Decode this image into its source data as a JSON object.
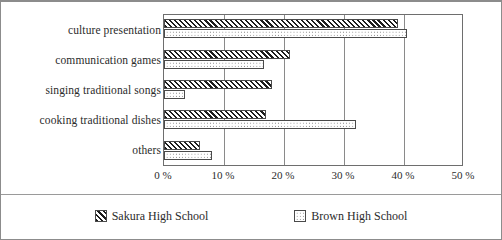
{
  "chart_data": {
    "type": "bar",
    "orientation": "horizontal",
    "title": "",
    "subtitle": "",
    "xlabel": "",
    "ylabel": "",
    "categories": [
      "culture presentation",
      "communication games",
      "singing traditional songs",
      "cooking traditional dishes",
      "others"
    ],
    "series": [
      {
        "name": "Sakura High School",
        "pattern": "diagonal-hatch",
        "values": [
          39,
          21,
          18,
          17,
          6
        ]
      },
      {
        "name": "Brown High School",
        "pattern": "dotted",
        "values": [
          40.5,
          16.7,
          3.5,
          32,
          8
        ]
      }
    ],
    "xlim": [
      0,
      50
    ],
    "xticks": [
      0,
      10,
      20,
      30,
      40,
      50
    ],
    "xtick_labels": [
      "0 %",
      "10 %",
      "20 %",
      "30 %",
      "40 %",
      "50 %"
    ],
    "grid": true,
    "grid_axis": "x",
    "legend_position": "bottom",
    "legend_entries": [
      "Sakura High School",
      "Brown High School"
    ]
  },
  "colors": {
    "background": "#ffffff",
    "frame": "#8c8c8c",
    "plot_border": "#6e6e6e",
    "gridline": "#8a8a8a",
    "bar_outline": "#4a4a4a",
    "hatch": "#1d1d1d",
    "dot": "#5d5d5d",
    "text": "#2b2b2b"
  }
}
